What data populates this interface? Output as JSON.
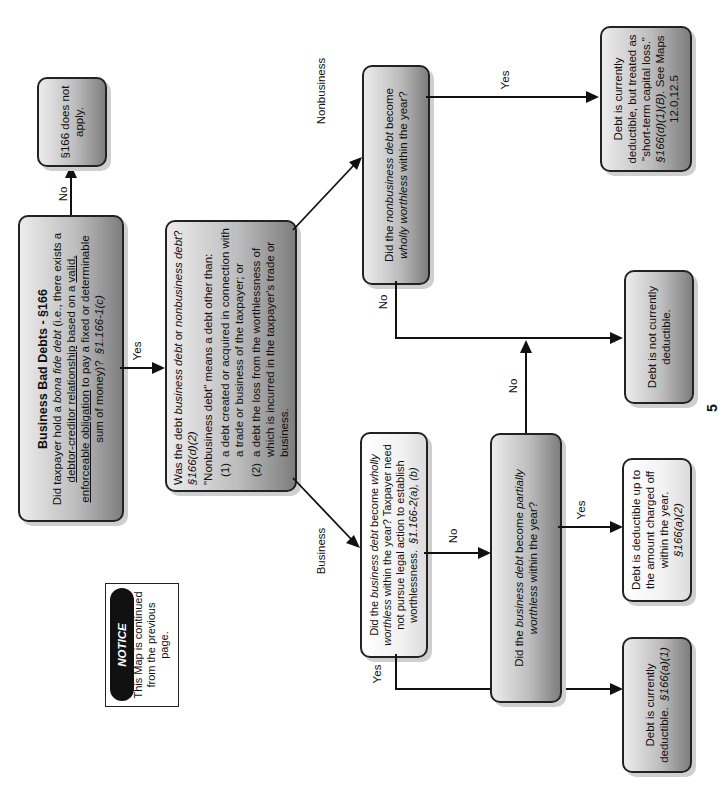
{
  "diagram": {
    "orientation": "rotated-90-ccw",
    "start": {
      "title": "Business Bad Debts - §166",
      "question_pre": "Did taxpayer hold a ",
      "question_italic": "bona fide debt",
      "question_mid": " (i.e., there exists a ",
      "u1": "debtor-creditor relationship",
      "mid2": " based on a ",
      "u2": "valid, enforceable obligation",
      "tail": " to pay a fixed or determinable sum of money)?",
      "cite": "§1.166-1(c)"
    },
    "no_apply": {
      "text": "§166 does not apply."
    },
    "type_question": {
      "q_pre": "Was the debt ",
      "q_i1": "business debt",
      "q_mid": " or ",
      "q_i2": "nonbusiness debt",
      "q_end": "?",
      "cite": "§166(d)(2)",
      "definition": "\"Nonbusiness debt\" means a debt other than:",
      "items": [
        {
          "num": "(1)",
          "text": "a debt created or acquired in connection with a trade or business of the taxpayer; or"
        },
        {
          "num": "(2)",
          "text": "a debt the loss from the worthlessness of which is incurred in the taxpayer's trade or business."
        }
      ]
    },
    "notice": {
      "label": "NOTICE",
      "text": "This Map is continued from the previous page."
    },
    "business_wholly": {
      "pre": "Did the ",
      "i1": "business debt",
      "mid": " become ",
      "i2": "wholly worthless",
      "post": " within the year?  Taxpayer need not pursue legal action to establish worthlessness.",
      "cite": "§1.166-2(a), (b)"
    },
    "nonbusiness_wholly": {
      "pre": "Did the ",
      "i1": "nonbusiness debt",
      "mid": " become ",
      "i2": "wholly worthless",
      "post": " within the year?"
    },
    "partially": {
      "pre": "Did the ",
      "i1": "business debt",
      "mid": " become ",
      "i2": "partially worthless",
      "post": " within the year?"
    },
    "outcomes": {
      "currently_deductible": {
        "text": "Debt is currently deductible.",
        "cite": "§166(a)(1)"
      },
      "partial_deductible": {
        "text": "Debt is deductible up to the amount charged off within the year.",
        "cite": "§166(a)(2)"
      },
      "not_deductible": {
        "text": "Debt is not currently deductible."
      },
      "stcl": {
        "text": "Debt is currently deductible, but treated as \"short-term capital loss.\"",
        "cite": "§166(d)(1)(B).",
        "see": "See Maps 12.0,12.5"
      }
    },
    "edge_labels": {
      "start_no": "No",
      "start_yes": "Yes",
      "business": "Business",
      "nonbusiness": "Nonbusiness",
      "bw_yes": "Yes",
      "bw_no": "No",
      "partial_yes": "Yes",
      "partial_no": "No",
      "nbw_no": "No",
      "nbw_yes": "Yes"
    },
    "page_number_fragment": "5"
  }
}
